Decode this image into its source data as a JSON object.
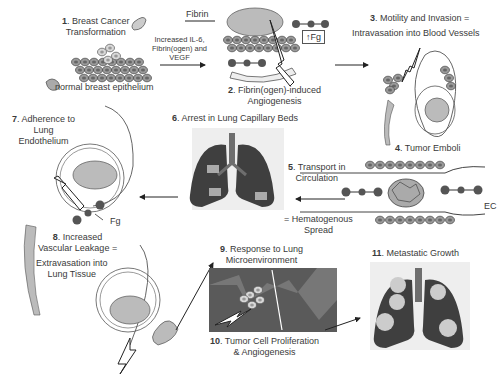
{
  "steps": [
    {
      "num": "1",
      "line1": ". Breast Cancer",
      "line2": "Transformation"
    },
    {
      "num": "2",
      "line1": ". Fibrin(ogen)-induced",
      "line2": "Angiogenesis"
    },
    {
      "num": "3",
      "line1": ". Motility and Invasion =",
      "line2": "Intravasation into Blood Vessels"
    },
    {
      "num": "4",
      "line1": ". Tumor Emboli"
    },
    {
      "num": "5",
      "line1": ". Transport in",
      "line2": "Circulation",
      "line3": "= Hematogenous",
      "line4": "Spread"
    },
    {
      "num": "6",
      "line1": ". Arrest in Lung Capillary Beds"
    },
    {
      "num": "7",
      "line1": ". Adherence to",
      "line2": "Lung",
      "line3": "Endothelium"
    },
    {
      "num": "8",
      "line1": ". Increased",
      "line2": "Vascular Leakage =",
      "line3": "Extravasation into",
      "line4": "Lung Tissue"
    },
    {
      "num": "9",
      "line1": ". Response to Lung",
      "line2": "Microenvironment"
    },
    {
      "num": "10",
      "line1": ". Tumor Cell Proliferation",
      "line2": "& Angiogenesis"
    },
    {
      "num": "11",
      "line1": ". Metastatic Growth"
    }
  ],
  "annotations": {
    "normal_epithelium": "normal breast epithelium",
    "fibrin": "Fibrin",
    "factors_l1": "Increased IL-6,",
    "factors_l2": "Fibrin(ogen) and",
    "factors_l3": "VEGF",
    "fg_up": "↑Fg",
    "fg": "Fg",
    "ec": "EC"
  },
  "colors": {
    "lung_dark": "#3f3f3f",
    "lung_bronchi": "#6e6e6e",
    "cell_fill": "#8a8a8a",
    "cell_light": "#cfcfcf",
    "line": "#333333",
    "tissue_bg": "#5a5a5a"
  }
}
